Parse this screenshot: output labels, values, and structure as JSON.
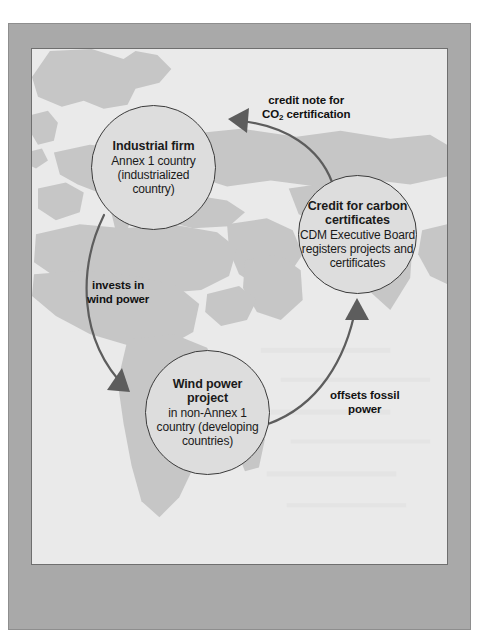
{
  "diagram": {
    "type": "cycle-diagram",
    "background": "world map (Europe, Africa, Middle East, Asia)",
    "colors": {
      "frame_band": "#a9a9a9",
      "panel_background": "#eaeaea",
      "landmass": "#c6c6c6",
      "node_fill": "#dddddd",
      "node_border": "#3b3b3b",
      "arrow": "#5d5d5d",
      "text": "#1a1a1a"
    }
  },
  "nodes": [
    {
      "id": "industrial-firm",
      "title": "Industrial firm",
      "sub_lines": [
        "Annex 1 country",
        "(industrialized",
        "country)"
      ]
    },
    {
      "id": "credit-for-carbon-certificates",
      "title_lines": [
        "Credit for carbon",
        "certificates"
      ],
      "sub_lines": [
        "CDM Executive Board",
        "registers projects and",
        "certificates"
      ]
    },
    {
      "id": "wind-power-project",
      "title_lines": [
        "Wind power",
        "project"
      ],
      "sub_lines": [
        "in non-Annex 1",
        "country (developing",
        "countries)"
      ]
    }
  ],
  "edges": [
    {
      "id": "invests-in-wind-power",
      "from": "industrial-firm",
      "to": "wind-power-project",
      "label_lines": [
        "invests in",
        "wind power"
      ]
    },
    {
      "id": "offsets-fossil-power",
      "from": "wind-power-project",
      "to": "credit-for-carbon-certificates",
      "label_lines": [
        "offsets fossil",
        "power"
      ]
    },
    {
      "id": "credit-note-for-co2-certification",
      "from": "credit-for-carbon-certificates",
      "to": "industrial-firm",
      "label_lines": [
        "credit note for",
        "CO2 certification"
      ],
      "label_line2_pre": "CO",
      "label_line2_sub": "2",
      "label_line2_post": " certification"
    }
  ],
  "labels": {
    "node1_title": "Industrial firm",
    "node1_sub1": "Annex 1 country",
    "node1_sub2": "(industrialized",
    "node1_sub3": "country)",
    "node2_title1": "Credit for carbon",
    "node2_title2": "certificates",
    "node2_sub1": "CDM Executive Board",
    "node2_sub2": "registers projects and",
    "node2_sub3": "certificates",
    "node3_title1": "Wind power",
    "node3_title2": "project",
    "node3_sub1": "in non-Annex 1",
    "node3_sub2": "country (developing",
    "node3_sub3": "countries)",
    "edge1_line1": "invests in",
    "edge1_line2": "wind power",
    "edge2_line1": "offsets fossil",
    "edge2_line2": "power",
    "edge3_line1": "credit note for",
    "edge3_line2_pre": "CO",
    "edge3_line2_sub": "2",
    "edge3_line2_post": " certification"
  }
}
